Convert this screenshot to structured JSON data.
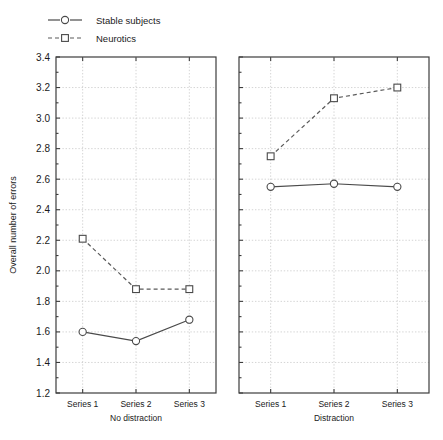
{
  "chart_data": {
    "type": "line",
    "title": "",
    "xlabel": "",
    "ylabel": "Overall number of errors",
    "ylim": [
      1.2,
      3.4
    ],
    "ytick_step": 0.2,
    "yticks": [
      "1.2",
      "1.4",
      "1.6",
      "1.8",
      "2.0",
      "2.2",
      "2.4",
      "2.6",
      "2.8",
      "3.0",
      "3.2",
      "3.4"
    ],
    "grid": true,
    "legend_position": "top-left",
    "categories": [
      "Series 1",
      "Series 2",
      "Series 3"
    ],
    "panels": [
      {
        "name": "No distraction",
        "series": [
          {
            "name": "Stable subjects",
            "values": [
              1.6,
              1.54,
              1.68
            ],
            "marker": "circle-open",
            "line": "solid"
          },
          {
            "name": "Neurotics",
            "values": [
              2.21,
              1.88,
              1.88
            ],
            "marker": "square-open",
            "line": "dashed"
          }
        ]
      },
      {
        "name": "Distraction",
        "series": [
          {
            "name": "Stable subjects",
            "values": [
              2.55,
              2.57,
              2.55
            ],
            "marker": "circle-open",
            "line": "solid"
          },
          {
            "name": "Neurotics",
            "values": [
              2.75,
              3.13,
              3.2
            ],
            "marker": "square-open",
            "line": "dashed"
          }
        ]
      }
    ],
    "legend": [
      {
        "label": "Stable subjects",
        "marker": "circle-open",
        "line": "solid"
      },
      {
        "label": "Neurotics",
        "marker": "square-open",
        "line": "dashed"
      }
    ],
    "colors": {
      "line_stable": "#4a4a4a",
      "line_neurotic": "#5a5a5a",
      "grid": "#c9c9c9",
      "frame": "#3c3c3c",
      "background": "#ffffff"
    }
  }
}
